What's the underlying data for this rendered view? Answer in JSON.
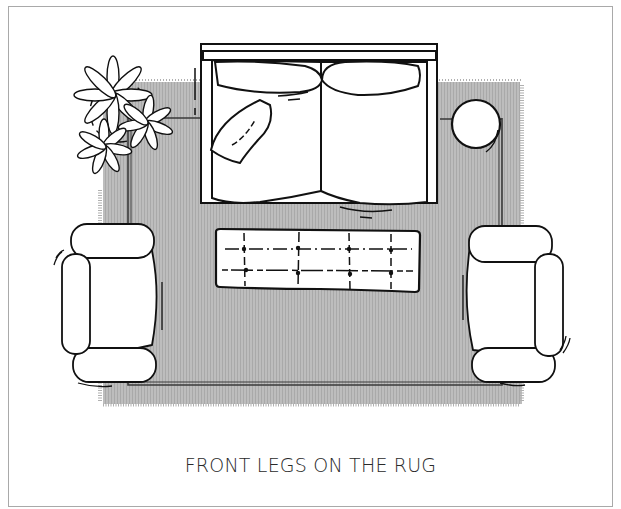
{
  "diagram": {
    "caption": "FRONT LEGS ON THE RUG",
    "colors": {
      "rug": "#b8b8b8",
      "rug_border": "#3a3a3a",
      "outline": "#111111",
      "furniture_fill": "#ffffff",
      "frame": "#a9a9a9",
      "caption": "#2a2a2a"
    },
    "elements": [
      {
        "id": "rug",
        "label": "Area rug with fringe"
      },
      {
        "id": "sofa",
        "label": "Sofa",
        "cushions": 2,
        "throw_pillows": 1
      },
      {
        "id": "plant",
        "label": "Potted plant"
      },
      {
        "id": "side-table",
        "label": "Round side table"
      },
      {
        "id": "armchair-left",
        "label": "Armchair (left)"
      },
      {
        "id": "armchair-right",
        "label": "Armchair (right)"
      },
      {
        "id": "ottoman",
        "label": "Tufted ottoman / coffee table",
        "tufts": 8
      }
    ]
  }
}
